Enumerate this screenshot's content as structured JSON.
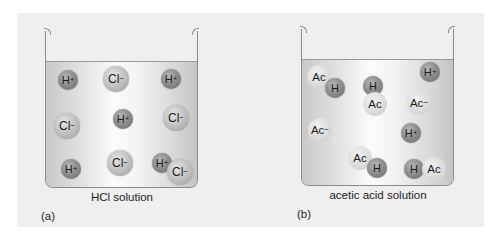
{
  "figure": {
    "panels": [
      {
        "id": "a",
        "label": "(a)",
        "caption": "HCl solution",
        "particles": [
          {
            "type": "h",
            "text": "H",
            "charge": "+",
            "x": 68,
            "y": 80
          },
          {
            "type": "cl",
            "text": "Cl",
            "charge": "−",
            "x": 116,
            "y": 79
          },
          {
            "type": "h",
            "text": "H",
            "charge": "+",
            "x": 171,
            "y": 79
          },
          {
            "type": "cl",
            "text": "Cl",
            "charge": "−",
            "x": 67,
            "y": 126
          },
          {
            "type": "h",
            "text": "H",
            "charge": "+",
            "x": 123,
            "y": 119
          },
          {
            "type": "cl",
            "text": "Cl",
            "charge": "−",
            "x": 176,
            "y": 118
          },
          {
            "type": "h",
            "text": "H",
            "charge": "+",
            "x": 71,
            "y": 169
          },
          {
            "type": "cl",
            "text": "Cl",
            "charge": "−",
            "x": 120,
            "y": 163
          },
          {
            "type": "h",
            "text": "H",
            "charge": "+",
            "x": 162,
            "y": 163
          },
          {
            "type": "cl",
            "text": "Cl",
            "charge": "−",
            "x": 180,
            "y": 172
          }
        ]
      },
      {
        "id": "b",
        "label": "(b)",
        "caption": "acetic acid solution",
        "particles": [
          {
            "type": "ac",
            "text": "Ac",
            "charge": "",
            "x": 319,
            "y": 77
          },
          {
            "type": "h",
            "text": "H",
            "charge": "",
            "x": 335,
            "y": 88
          },
          {
            "type": "h",
            "text": "H",
            "charge": "",
            "x": 373,
            "y": 86
          },
          {
            "type": "ac",
            "text": "Ac",
            "charge": "",
            "x": 375,
            "y": 104
          },
          {
            "type": "h",
            "text": "H",
            "charge": "+",
            "x": 430,
            "y": 72
          },
          {
            "type": "ac",
            "text": "Ac",
            "charge": "−",
            "x": 419,
            "y": 103
          },
          {
            "type": "ac",
            "text": "Ac",
            "charge": "−",
            "x": 320,
            "y": 130
          },
          {
            "type": "h",
            "text": "H",
            "charge": "+",
            "x": 411,
            "y": 133
          },
          {
            "type": "ac",
            "text": "Ac",
            "charge": "",
            "x": 360,
            "y": 158
          },
          {
            "type": "h",
            "text": "H",
            "charge": "",
            "x": 377,
            "y": 168
          },
          {
            "type": "h",
            "text": "H",
            "charge": "",
            "x": 414,
            "y": 169
          },
          {
            "type": "ac",
            "text": "Ac",
            "charge": "",
            "x": 434,
            "y": 169
          }
        ]
      }
    ]
  }
}
